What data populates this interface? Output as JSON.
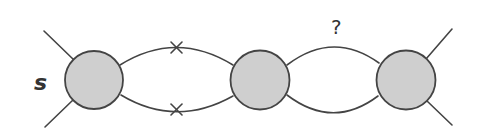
{
  "diagram": {
    "type": "feynman-diagram",
    "labels": {
      "external_label": "s",
      "unknown_label": "?"
    },
    "colors": {
      "stroke": "#444444",
      "vertex_fill": "#cfcfcf",
      "text": "#333333",
      "background": "#ffffff"
    },
    "vertices": [
      {
        "id": "left-blob",
        "cx": 94,
        "cy": 80,
        "r": 29
      },
      {
        "id": "middle-blob",
        "cx": 260,
        "cy": 80,
        "r": 29.5
      },
      {
        "id": "right-blob",
        "cx": 406,
        "cy": 80,
        "r": 29.5
      }
    ],
    "loops": [
      {
        "between": [
          "left-blob",
          "middle-blob"
        ],
        "upper_marker": "cross",
        "lower_marker": "cross"
      },
      {
        "between": [
          "middle-blob",
          "right-blob"
        ],
        "annotation": "?"
      }
    ],
    "external_legs": 4
  }
}
